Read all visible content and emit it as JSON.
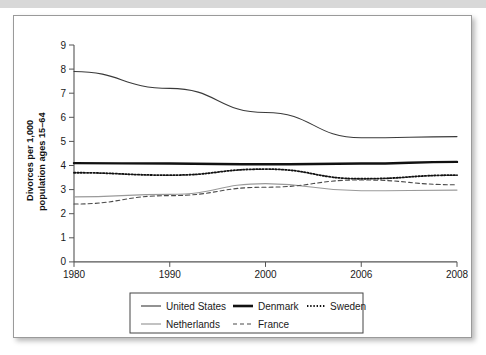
{
  "figure": {
    "background_color": "#ffffff",
    "border_color": "#9a9a9a",
    "top_band_color": "#d8d8d8"
  },
  "chart_data": {
    "type": "line",
    "title": "",
    "xlabel": "",
    "ylabel": "Divorces per 1,000 population ages 15–64",
    "ylabel_line1": "Divorces per 1,000",
    "ylabel_line2": "population ages 15–64",
    "categories": [
      "1980",
      "1990",
      "2000",
      "2006",
      "2008"
    ],
    "x": [
      1980,
      1990,
      2000,
      2006,
      2008
    ],
    "xtick_labels": [
      "1980",
      "1990",
      "2000",
      "2006",
      "2008"
    ],
    "ytick_labels": [
      "0",
      "1",
      "2",
      "3",
      "4",
      "5",
      "6",
      "7",
      "8",
      "9"
    ],
    "yticks": [
      0,
      1,
      2,
      3,
      4,
      5,
      6,
      7,
      8,
      9
    ],
    "ylim": [
      0,
      9
    ],
    "grid": false,
    "legend_position": "bottom",
    "series": [
      {
        "name": "United States",
        "values": [
          7.9,
          7.2,
          6.2,
          5.15,
          5.2
        ],
        "style": "solid",
        "width": 1.1,
        "color": "#3a3a3a"
      },
      {
        "name": "Denmark",
        "values": [
          4.1,
          4.08,
          4.05,
          4.08,
          4.15
        ],
        "style": "solid",
        "width": 2.4,
        "color": "#111111"
      },
      {
        "name": "Sweden",
        "values": [
          3.7,
          3.6,
          3.85,
          3.45,
          3.6
        ],
        "style": "dotted",
        "width": 1.8,
        "color": "#111111"
      },
      {
        "name": "Netherlands",
        "values": [
          2.7,
          2.8,
          3.25,
          2.95,
          2.98
        ],
        "style": "solid",
        "width": 1.1,
        "color": "#9a9a9a"
      },
      {
        "name": "France",
        "values": [
          2.4,
          2.75,
          3.1,
          3.4,
          3.2
        ],
        "style": "dashed",
        "width": 1.1,
        "color": "#4a4a4a"
      }
    ],
    "legend_entries": [
      {
        "label": "United States",
        "style": "solid-thin",
        "color": "#3a3a3a"
      },
      {
        "label": "Denmark",
        "style": "solid-thick",
        "color": "#111111"
      },
      {
        "label": "Sweden",
        "style": "dotted",
        "color": "#111111"
      },
      {
        "label": "Netherlands",
        "style": "solid-gray",
        "color": "#9a9a9a"
      },
      {
        "label": "France",
        "style": "dashed",
        "color": "#4a4a4a"
      }
    ]
  }
}
